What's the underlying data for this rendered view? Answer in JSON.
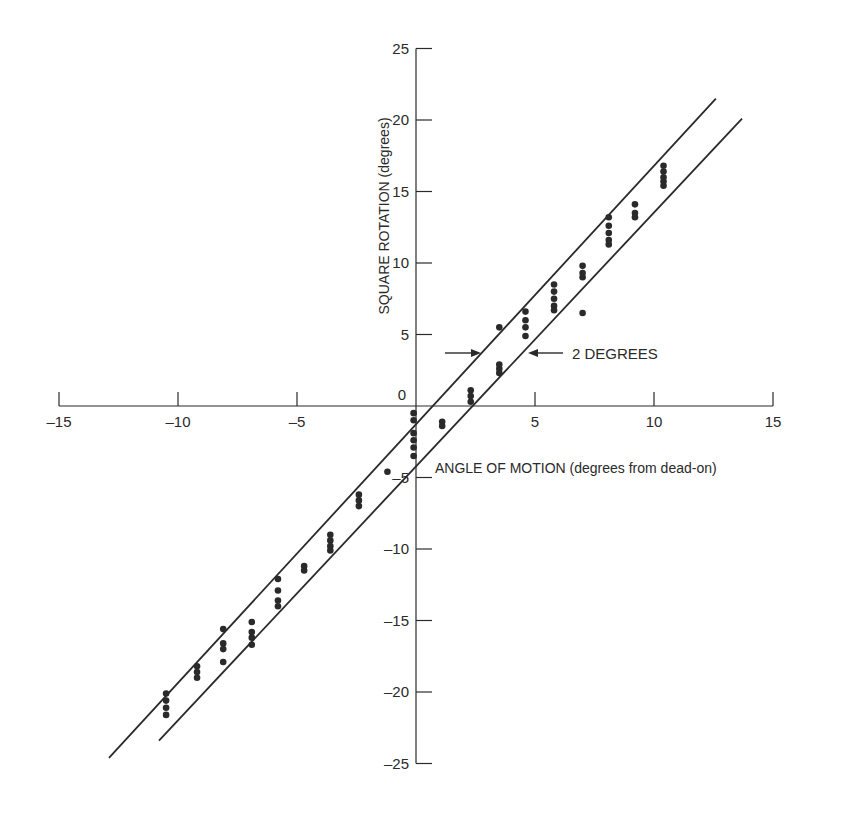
{
  "chart_data": {
    "type": "scatter",
    "title": "",
    "xlabel": "ANGLE OF MOTION (degrees from dead-on)",
    "ylabel": "SQUARE ROTATION (degrees)",
    "xlim": [
      -15,
      15
    ],
    "ylim": [
      -25,
      25
    ],
    "x_ticks": [
      "-15",
      "-10",
      "-5",
      "0",
      "5",
      "10",
      "15"
    ],
    "y_ticks": [
      "25",
      "20",
      "15",
      "10",
      "5",
      "0",
      "-5",
      "-10",
      "-15",
      "-20",
      "-25"
    ],
    "grid": false,
    "legend": null,
    "annotations": [
      {
        "text": "2 DEGREES",
        "description": "arrows indicating the 2-degree horizontal gap between the two parallel boundary lines"
      }
    ],
    "reference_lines": [
      {
        "name": "upper-boundary",
        "x": [
          -12.9,
          12.6
        ],
        "y": [
          -24.6,
          21.5
        ]
      },
      {
        "name": "lower-boundary",
        "x": [
          -10.8,
          13.7
        ],
        "y": [
          -23.4,
          20.1
        ]
      }
    ],
    "series": [
      {
        "name": "observations",
        "points": [
          {
            "x": -10.5,
            "y": -20.1
          },
          {
            "x": -10.5,
            "y": -20.6
          },
          {
            "x": -10.5,
            "y": -21.1
          },
          {
            "x": -10.5,
            "y": -21.6
          },
          {
            "x": -9.2,
            "y": -18.2
          },
          {
            "x": -9.2,
            "y": -18.6
          },
          {
            "x": -9.2,
            "y": -19.0
          },
          {
            "x": -8.1,
            "y": -15.6
          },
          {
            "x": -8.1,
            "y": -16.6
          },
          {
            "x": -8.1,
            "y": -17.0
          },
          {
            "x": -8.1,
            "y": -17.9
          },
          {
            "x": -6.9,
            "y": -15.1
          },
          {
            "x": -6.9,
            "y": -15.8
          },
          {
            "x": -6.9,
            "y": -16.2
          },
          {
            "x": -6.9,
            "y": -16.7
          },
          {
            "x": -5.8,
            "y": -12.1
          },
          {
            "x": -5.8,
            "y": -12.9
          },
          {
            "x": -5.8,
            "y": -13.6
          },
          {
            "x": -5.8,
            "y": -14.0
          },
          {
            "x": -4.7,
            "y": -11.2
          },
          {
            "x": -4.7,
            "y": -11.5
          },
          {
            "x": -3.6,
            "y": -9.0
          },
          {
            "x": -3.6,
            "y": -9.4
          },
          {
            "x": -3.6,
            "y": -9.8
          },
          {
            "x": -3.6,
            "y": -10.1
          },
          {
            "x": -2.4,
            "y": -6.2
          },
          {
            "x": -2.4,
            "y": -6.6
          },
          {
            "x": -2.4,
            "y": -7.0
          },
          {
            "x": -1.2,
            "y": -4.6
          },
          {
            "x": -0.1,
            "y": -0.5
          },
          {
            "x": -0.1,
            "y": -1.0
          },
          {
            "x": -0.1,
            "y": -1.9
          },
          {
            "x": -0.1,
            "y": -2.4
          },
          {
            "x": -0.1,
            "y": -2.9
          },
          {
            "x": -0.1,
            "y": -3.5
          },
          {
            "x": 1.1,
            "y": -1.1
          },
          {
            "x": 1.1,
            "y": -1.4
          },
          {
            "x": 2.3,
            "y": 1.1
          },
          {
            "x": 2.3,
            "y": 0.7
          },
          {
            "x": 2.3,
            "y": 0.3
          },
          {
            "x": 3.5,
            "y": 5.5
          },
          {
            "x": 3.5,
            "y": 2.9
          },
          {
            "x": 3.5,
            "y": 2.6
          },
          {
            "x": 3.5,
            "y": 2.3
          },
          {
            "x": 4.6,
            "y": 6.6
          },
          {
            "x": 4.6,
            "y": 6.0
          },
          {
            "x": 4.6,
            "y": 5.5
          },
          {
            "x": 4.6,
            "y": 4.9
          },
          {
            "x": 5.8,
            "y": 8.5
          },
          {
            "x": 5.8,
            "y": 8.0
          },
          {
            "x": 5.8,
            "y": 7.5
          },
          {
            "x": 5.8,
            "y": 7.0
          },
          {
            "x": 5.8,
            "y": 6.7
          },
          {
            "x": 7.0,
            "y": 9.8
          },
          {
            "x": 7.0,
            "y": 9.3
          },
          {
            "x": 7.0,
            "y": 9.0
          },
          {
            "x": 7.0,
            "y": 6.5
          },
          {
            "x": 8.1,
            "y": 13.2
          },
          {
            "x": 8.1,
            "y": 12.6
          },
          {
            "x": 8.1,
            "y": 12.1
          },
          {
            "x": 8.1,
            "y": 11.6
          },
          {
            "x": 8.1,
            "y": 11.3
          },
          {
            "x": 9.2,
            "y": 14.1
          },
          {
            "x": 9.2,
            "y": 13.5
          },
          {
            "x": 9.2,
            "y": 13.2
          },
          {
            "x": 10.4,
            "y": 16.8
          },
          {
            "x": 10.4,
            "y": 16.4
          },
          {
            "x": 10.4,
            "y": 16.0
          },
          {
            "x": 10.4,
            "y": 15.7
          },
          {
            "x": 10.4,
            "y": 15.4
          }
        ]
      }
    ]
  },
  "labels": {
    "xlabel": "ANGLE OF MOTION (degrees from dead-on)",
    "ylabel": "SQUARE ROTATION (degrees)",
    "annotation": "2 DEGREES"
  },
  "colors": {
    "ink": "#2a2a2a",
    "background": "#ffffff"
  }
}
